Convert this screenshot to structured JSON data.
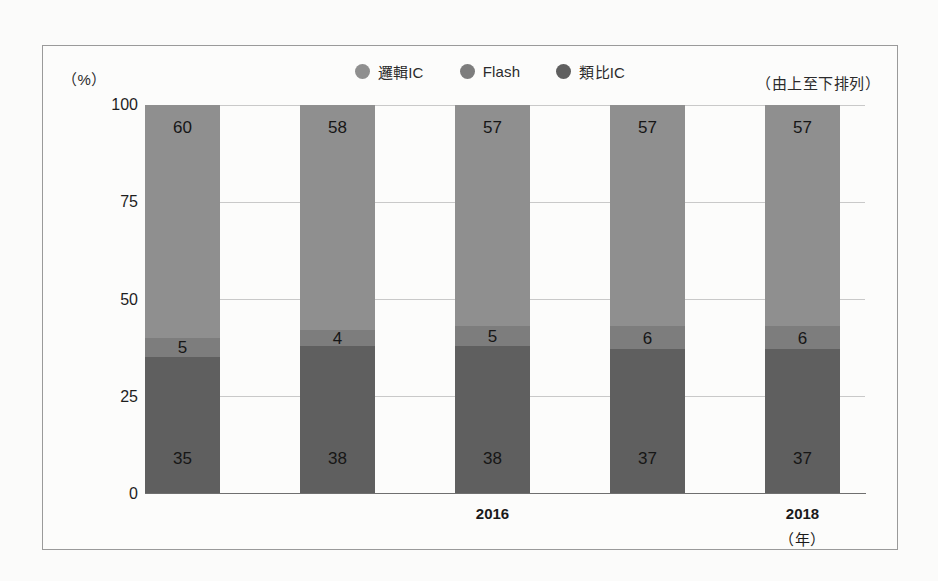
{
  "figure": {
    "unit_label": "（%）",
    "note": "（由上至下排列）"
  },
  "legend": {
    "items": [
      {
        "label": "邏輯IC",
        "color": "#8f8f8f",
        "icon": "circle-marker-icon"
      },
      {
        "label": "Flash",
        "color": "#7d7d7d",
        "icon": "circle-marker-icon"
      },
      {
        "label": "類比IC",
        "color": "#5f5f5f",
        "icon": "circle-marker-icon"
      }
    ]
  },
  "axes": {
    "y_ticks": [
      "100",
      "75",
      "50",
      "25",
      "0"
    ],
    "x_labels": [
      {
        "text": "2016",
        "bar_index": 2
      },
      {
        "text": "2018",
        "bar_index": 4
      }
    ],
    "x_unit": "（年）"
  },
  "chart_data": {
    "type": "bar",
    "stacked": true,
    "stack_order": "top-to-bottom",
    "title": "",
    "subtitle": "",
    "xlabel": "（年）",
    "ylabel": "（%）",
    "ylim": [
      0,
      100
    ],
    "yticks": [
      0,
      25,
      50,
      75,
      100
    ],
    "grid": true,
    "legend_position": "top-center",
    "categories": [
      "2014",
      "2015",
      "2016",
      "2017",
      "2018"
    ],
    "visible_category_labels": [
      "",
      "",
      "2016",
      "",
      "2018"
    ],
    "series": [
      {
        "name": "邏輯IC",
        "color": "#8f8f8f",
        "values": [
          60,
          58,
          57,
          57,
          57
        ]
      },
      {
        "name": "Flash",
        "color": "#7d7d7d",
        "values": [
          5,
          4,
          5,
          6,
          6
        ]
      },
      {
        "name": "類比IC",
        "color": "#5f5f5f",
        "values": [
          35,
          38,
          38,
          37,
          37
        ]
      }
    ],
    "annotations": [
      "（由上至下排列）"
    ]
  }
}
